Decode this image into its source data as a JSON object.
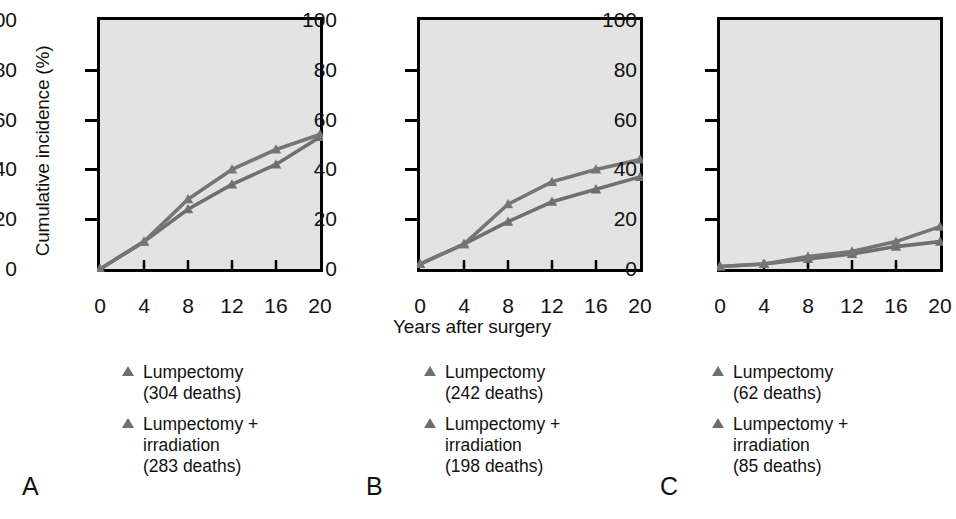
{
  "figure": {
    "y_axis_title": "Cumulative incidence (%)",
    "x_axis_title": "Years after surgery",
    "background": "#ffffff",
    "plot_background": "#e3e3e3",
    "series_colors": [
      "#6f6f6f",
      "#757575"
    ]
  },
  "axes": {
    "y_ticks": [
      "0",
      "20",
      "40",
      "60",
      "80",
      "100"
    ],
    "x_ticks": [
      "0",
      "4",
      "8",
      "12",
      "16",
      "20"
    ],
    "xlim": [
      0,
      20
    ],
    "ylim": [
      0,
      100
    ]
  },
  "panels": [
    {
      "letter": "A",
      "legend": [
        {
          "marker": "triangle-up-marker",
          "line1": "Lumpectomy",
          "line2": "(304 deaths)",
          "line3": ""
        },
        {
          "marker": "triangle-up-marker",
          "line1": "Lumpectomy +",
          "line2": "irradiation",
          "line3": "(283 deaths)"
        }
      ]
    },
    {
      "letter": "B",
      "legend": [
        {
          "marker": "triangle-up-marker",
          "line1": "Lumpectomy",
          "line2": "(242 deaths)",
          "line3": ""
        },
        {
          "marker": "triangle-up-marker",
          "line1": "Lumpectomy +",
          "line2": "irradiation",
          "line3": "(198 deaths)"
        }
      ]
    },
    {
      "letter": "C",
      "legend": [
        {
          "marker": "triangle-up-marker",
          "line1": "Lumpectomy",
          "line2": "(62 deaths)",
          "line3": ""
        },
        {
          "marker": "triangle-up-marker",
          "line1": "Lumpectomy +",
          "line2": "irradiation",
          "line3": "(85 deaths)"
        }
      ]
    }
  ],
  "chart_data": [
    {
      "type": "line",
      "panel": "A",
      "title": "",
      "xlabel": "Years after surgery",
      "ylabel": "Cumulative incidence (%)",
      "xlim": [
        0,
        20
      ],
      "ylim": [
        0,
        100
      ],
      "grid": false,
      "legend_position": "below",
      "x": [
        0,
        4,
        8,
        12,
        16,
        20
      ],
      "series": [
        {
          "name": "Lumpectomy (304 deaths)",
          "values": [
            0,
            11,
            24,
            34,
            42,
            53
          ]
        },
        {
          "name": "Lumpectomy + irradiation (283 deaths)",
          "values": [
            0,
            11,
            28,
            40,
            48,
            54
          ]
        }
      ]
    },
    {
      "type": "line",
      "panel": "B",
      "title": "",
      "xlabel": "Years after surgery",
      "ylabel": "Cumulative incidence (%)",
      "xlim": [
        0,
        20
      ],
      "ylim": [
        0,
        100
      ],
      "grid": false,
      "legend_position": "below",
      "x": [
        0,
        4,
        8,
        12,
        16,
        20
      ],
      "series": [
        {
          "name": "Lumpectomy (242 deaths)",
          "values": [
            2,
            10,
            19,
            27,
            32,
            37
          ]
        },
        {
          "name": "Lumpectomy + irradiation (198 deaths)",
          "values": [
            2,
            10,
            26,
            35,
            40,
            44
          ]
        }
      ]
    },
    {
      "type": "line",
      "panel": "C",
      "title": "",
      "xlabel": "Years after surgery",
      "ylabel": "Cumulative incidence (%)",
      "xlim": [
        0,
        20
      ],
      "ylim": [
        0,
        100
      ],
      "grid": false,
      "legend_position": "below",
      "x": [
        0,
        4,
        8,
        12,
        16,
        20
      ],
      "series": [
        {
          "name": "Lumpectomy (62 deaths)",
          "values": [
            1,
            2,
            4,
            6,
            9,
            11
          ]
        },
        {
          "name": "Lumpectomy + irradiation (85 deaths)",
          "values": [
            1,
            2,
            5,
            7,
            11,
            17
          ]
        }
      ]
    }
  ]
}
